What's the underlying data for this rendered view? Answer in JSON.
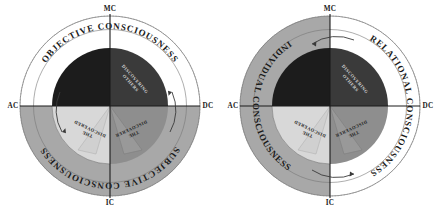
{
  "figure": {
    "title": "",
    "diagrams": [
      {
        "id": "left",
        "name": "objective-subjective-consciousness",
        "axes": {
          "top": "MC",
          "bottom": "IC",
          "left": "AC",
          "right": "DC"
        },
        "outer_arcs": [
          {
            "position": "top",
            "label": "OBJECTIVE CONSCIOUSNESS",
            "fill": "#ffffff"
          },
          {
            "position": "bottom",
            "label": "SUBJECTIVE CONSCIOUSNESS",
            "fill": "#a8a8a8"
          }
        ],
        "quadrants": [
          {
            "position": "top-left",
            "label": "",
            "fill": "#1c1c1c"
          },
          {
            "position": "top-right",
            "label": "DISCOVERING OTHERS",
            "fill": "#3a3a3a"
          },
          {
            "position": "bottom-left",
            "label": "THE DISCOVERED",
            "fill": "#d8d8d8"
          },
          {
            "position": "bottom-right",
            "label": "THE DISCOVERER",
            "fill": "#8e8e8e"
          }
        ],
        "arrows": [
          "left-curved-arrow",
          "right-curved-arrow"
        ]
      },
      {
        "id": "right",
        "name": "individual-relational-consciousness",
        "axes": {
          "top": "MC",
          "bottom": "IC",
          "left": "AC",
          "right": "DC"
        },
        "outer_arcs": [
          {
            "position": "left",
            "label": "INDIVIDUAL CONSCIOUSNESS",
            "fill": "#a8a8a8"
          },
          {
            "position": "right",
            "label": "RELATIONAL CONSCIOUSNESS",
            "fill": "#ffffff"
          }
        ],
        "quadrants": [
          {
            "position": "top-left",
            "label": "",
            "fill": "#1c1c1c"
          },
          {
            "position": "top-right",
            "label": "DISCOVERING OTHERS",
            "fill": "#3a3a3a"
          },
          {
            "position": "bottom-left",
            "label": "THE DISCOVERED",
            "fill": "#d8d8d8"
          },
          {
            "position": "bottom-right",
            "label": "THE DISCOVERER",
            "fill": "#8e8e8e"
          }
        ],
        "arrows": [
          "top-curved-arrow",
          "bottom-curved-arrow"
        ]
      }
    ],
    "colors": {
      "ink": "#1a1a1a",
      "outer_light": "#ffffff",
      "outer_shaded": "#a8a8a8",
      "quad_black": "#1c1c1c",
      "quad_dark": "#3a3a3a",
      "quad_light": "#d8d8d8",
      "quad_mid": "#8e8e8e"
    }
  }
}
